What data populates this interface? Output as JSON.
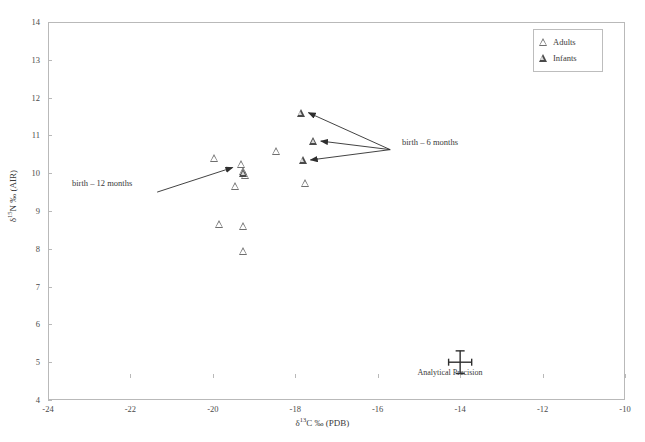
{
  "chart_data": {
    "type": "scatter",
    "title": "",
    "xlabel": "δ13C ‰ (PDB)",
    "ylabel": "δ15N ‰ (AIR)",
    "xlim": [
      -24,
      -10
    ],
    "ylim": [
      4,
      14
    ],
    "xticks": [
      -24,
      -22,
      -20,
      -18,
      -16,
      -14,
      -12,
      -10
    ],
    "yticks": [
      4,
      5,
      6,
      7,
      8,
      9,
      10,
      11,
      12,
      13,
      14
    ],
    "grid": false,
    "legend_position": "top-right",
    "series": [
      {
        "name": "Adults",
        "marker": "open-triangle",
        "points": [
          {
            "x": -19.95,
            "y": 10.4
          },
          {
            "x": -19.3,
            "y": 10.25
          },
          {
            "x": -19.25,
            "y": 10.05
          },
          {
            "x": -19.2,
            "y": 9.95
          },
          {
            "x": -19.45,
            "y": 9.65
          },
          {
            "x": -19.85,
            "y": 8.65
          },
          {
            "x": -19.25,
            "y": 8.6
          },
          {
            "x": -19.25,
            "y": 7.95
          },
          {
            "x": -18.45,
            "y": 10.6
          },
          {
            "x": -17.75,
            "y": 9.75
          }
        ]
      },
      {
        "name": "Infants",
        "marker": "filled-triangle",
        "points": [
          {
            "x": -17.85,
            "y": 11.6
          },
          {
            "x": -17.55,
            "y": 10.85
          },
          {
            "x": -17.8,
            "y": 10.35
          },
          {
            "x": -19.25,
            "y": 10.0
          }
        ]
      }
    ],
    "annotations": [
      {
        "id": "birth-6-months",
        "text": "birth – 6 months",
        "x": -15.6,
        "y": 10.65,
        "arrow_targets": [
          {
            "x": -17.85,
            "y": 11.6
          },
          {
            "x": -17.55,
            "y": 10.85
          },
          {
            "x": -17.8,
            "y": 10.35
          }
        ]
      },
      {
        "id": "birth-12-months",
        "text": "birth – 12 months",
        "x": -21.4,
        "y": 9.5,
        "arrow_targets": [
          {
            "x": -19.35,
            "y": 10.15
          }
        ]
      }
    ],
    "error_marker": {
      "label": "Analytical Precision",
      "x": -14.0,
      "y": 5.0,
      "x_error": 0.28,
      "y_error": 0.3
    }
  },
  "axis": {
    "x_title": "δ13C ‰ (PDB)",
    "x_title_delta": "δ",
    "x_title_sup": "13",
    "x_title_rest": "C ‰ (PDB)",
    "y_title_delta": "δ",
    "y_title_sup": "15",
    "y_title_rest": "N ‰ (AIR)",
    "x_tick_labels": [
      "-24",
      "-22",
      "-20",
      "-18",
      "-16",
      "-14",
      "-12",
      "-10"
    ],
    "y_tick_labels": [
      "4",
      "5",
      "6",
      "7",
      "8",
      "9",
      "10",
      "11",
      "12",
      "13",
      "14"
    ]
  },
  "legend": {
    "items": [
      {
        "label": "Adults",
        "marker": "open-triangle"
      },
      {
        "label": "Infants",
        "marker": "filled-triangle"
      }
    ]
  },
  "annotations": {
    "birth_6_months": "birth – 6 months",
    "birth_12_months": "birth – 12 months",
    "analytical_precision": "Analytical Precision"
  },
  "colors": {
    "frame": "#b9b9b9",
    "marker_adult": "#6e6e6e",
    "marker_infant": "#4a4a4a",
    "arrow": "#2e2e2e",
    "text": "#3a3a3a"
  }
}
